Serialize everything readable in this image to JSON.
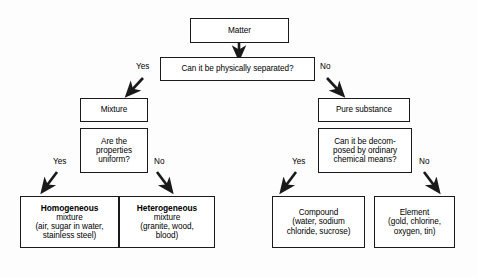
{
  "diagram": {
    "background_color": "#fdfdfd",
    "line_color": "#1a1a1a",
    "nodes": {
      "matter": {
        "label": "Matter"
      },
      "q_separated": {
        "label": "Can it be physically separated?"
      },
      "mixture": {
        "label": "Mixture"
      },
      "q_uniform": {
        "line1": "Are the",
        "line2": "properties",
        "line3": "uniform?"
      },
      "pure_substance": {
        "label": "Pure substance"
      },
      "q_decomposed": {
        "line1": "Can it be decom-",
        "line2": "posed by ordinary",
        "line3": "chemical means?"
      },
      "homogeneous": {
        "line1": "Homogeneous",
        "line2": "mixture",
        "line3": "(air, sugar in water,",
        "line4": "stainless steel)"
      },
      "heterogeneous": {
        "line1": "Heterogeneous",
        "line2": "mixture",
        "line3": "(granite, wood,",
        "line4": "blood)"
      },
      "compound": {
        "line1": "Compound",
        "line2": "(water, sodium",
        "line3": "chloride, sucrose)"
      },
      "element": {
        "line1": "Element",
        "line2": "(gold, chlorine,",
        "line3": "oxygen, tin)"
      }
    },
    "edge_labels": {
      "separated_yes": "Yes",
      "separated_no": "No",
      "uniform_yes": "Yes",
      "uniform_no": "No",
      "decomposed_yes": "Yes",
      "decomposed_no": "No"
    }
  }
}
